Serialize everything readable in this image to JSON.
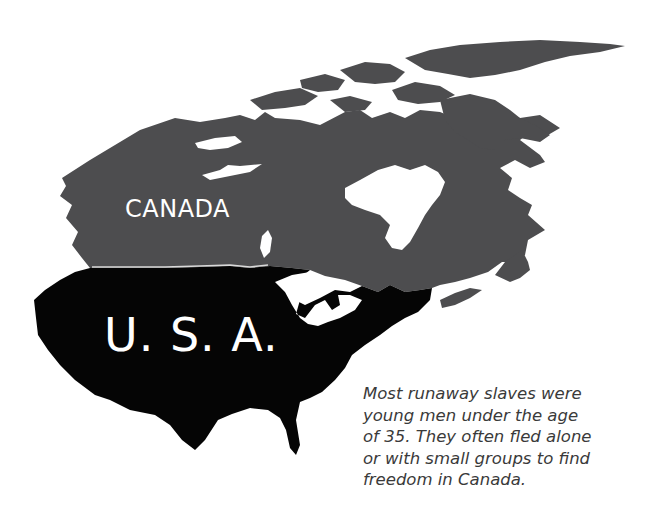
{
  "map": {
    "title": "Canada and U.S.A. map",
    "regions": [
      {
        "name": "Canada",
        "label": "CANADA",
        "color": "#4d4d4f"
      },
      {
        "name": "U.S.A.",
        "label": "U. S. A.",
        "color": "#050505"
      }
    ],
    "water_color": "#ffffff",
    "border_color": "#d9d9d9"
  },
  "caption": {
    "lines": [
      "Most runaway slaves were",
      "young men under the age",
      "of 35. They often fled alone",
      "or with small groups to find",
      "freedom in Canada."
    ],
    "color": "#3a3a3a"
  }
}
